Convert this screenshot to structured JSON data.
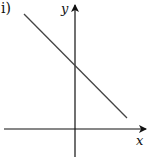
{
  "figure": {
    "panel_label": "i)",
    "x_axis_label": "x",
    "y_axis_label": "y",
    "colors": {
      "axis": "#111111",
      "line": "#444444",
      "background": "#ffffff"
    }
  },
  "geometry": {
    "origin": {
      "x": 75,
      "y": 129
    },
    "x_axis": {
      "x1": 4,
      "x2": 146,
      "y": 129
    },
    "y_axis": {
      "x": 75,
      "y1": 157,
      "y2": 5
    },
    "line": {
      "x1": 24,
      "y1": 14,
      "x2": 127,
      "y2": 118
    },
    "y_intercept_px": {
      "x": 75,
      "y": 65
    }
  },
  "description": {
    "slope": "negative",
    "y_intercept": "positive",
    "x_intercept": "positive (beyond visible segment)"
  }
}
